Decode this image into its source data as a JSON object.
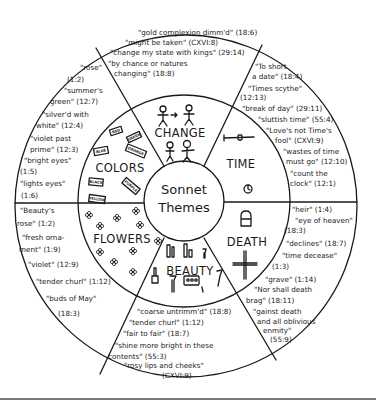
{
  "title": "Sonnet Themes",
  "center": {
    "line1": "Sonnet",
    "line2": "Themes"
  },
  "colors": {
    "ink": "#1a1a1a",
    "background": "#ffffff",
    "rule": "#7a7a7a"
  },
  "themes": {
    "change": {
      "label": "CHANGE",
      "icons": [
        "stick-figures-transform-icon",
        "stick-figures-transform-icon"
      ],
      "quotes": [
        "\"gold complexion dimm'd\" (18:6)",
        "\"might be taken\" (CXVI:8)",
        "\"change my state with kings\" (29:14)",
        "\"by chance or natures",
        "changing\" (18:8)"
      ]
    },
    "time": {
      "label": "TIME",
      "icons": [
        "scythe-icon",
        "clock-icon"
      ],
      "quotes": [
        "\"To short",
        "a date\" (18:4)",
        "\"Times scythe\"",
        "(12:13)",
        "\"break of day\" (29:11)",
        "\"sluttish time\" (55:4)",
        "\"Love's not Time's",
        "fool\" (CXVI:9)",
        "\"wastes of time",
        "must go\" (12:10)",
        "\"count the",
        "clock\" (12:1)"
      ]
    },
    "death": {
      "label": "DEATH",
      "icons": [
        "tombstone-icon",
        "cross-icon"
      ],
      "quotes": [
        "\"heir\" (1:4)",
        "\"eye of heaven\"",
        "(18:3)",
        "\"declines\" (18:7)",
        "\"time decease\"",
        "(1:3)",
        "\"grave\" (1:14)",
        "\"Nor shall death",
        "brag\" (18:11)",
        "\"gainst death",
        "and all oblivious",
        "enmity\"",
        "(55:9)"
      ]
    },
    "beauty": {
      "label": "BEAUTY",
      "icons": [
        "makeup-brush-icon",
        "lipstick-icon",
        "nail-polish-icon",
        "eyeshadow-palette-icon",
        "mascara-icon"
      ],
      "quotes": [
        "\"coarse untrimm'd\" (18:8)",
        "\"tender churl\" (1:12)",
        "\"fair to fair\" (18:7)",
        "\"shine more bright in these",
        "contents\" (55:3)",
        "\"rosy lips and cheeks\"",
        "(CXVI:9)"
      ]
    },
    "flowers": {
      "label": "FLOWERS",
      "icons": [
        "flower-icon"
      ],
      "quotes": [
        "\"Beauty's",
        "rose\" (1:2)",
        "\"fresh orna-",
        "ment\" (1:9)",
        "\"violet\" (12:9)",
        "\"tender churl\" (1:12)",
        "\"buds of May\"",
        "(18:3)"
      ]
    },
    "colors_theme": {
      "label": "COLORS",
      "tags": [
        "RED",
        "GREEN",
        "BLUE",
        "ORANGE",
        "BLACK",
        "PURPLE",
        "YELLOW"
      ],
      "quotes": [
        "\"rose\"",
        "(1:2)",
        "\"summer's",
        "green\" (12:7)",
        "\"silver'd with",
        "white\" (12:4)",
        "\"violet past",
        "prime\" (12:3)",
        "\"bright eyes\"",
        "(1:5)",
        "\"lights eyes\"",
        "(1:6)"
      ]
    }
  }
}
